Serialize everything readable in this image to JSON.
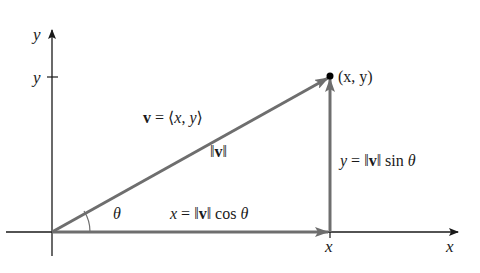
{
  "diagram": {
    "axes": {
      "x_label": "x",
      "y_label": "y",
      "x_tick_label": "x",
      "y_tick_label": "y"
    },
    "point": {
      "label": "(x, y)"
    },
    "vector": {
      "definition": "v = ⟨x, y⟩",
      "magnitude": "‖v‖"
    },
    "components": {
      "horizontal": "x = ‖v‖ cos θ",
      "vertical": "y = ‖v‖ sin θ"
    },
    "angle": {
      "label": "θ"
    },
    "colors": {
      "axis": "#1a1a1a",
      "vector": "#6e6e6e",
      "point": "#000000"
    }
  }
}
